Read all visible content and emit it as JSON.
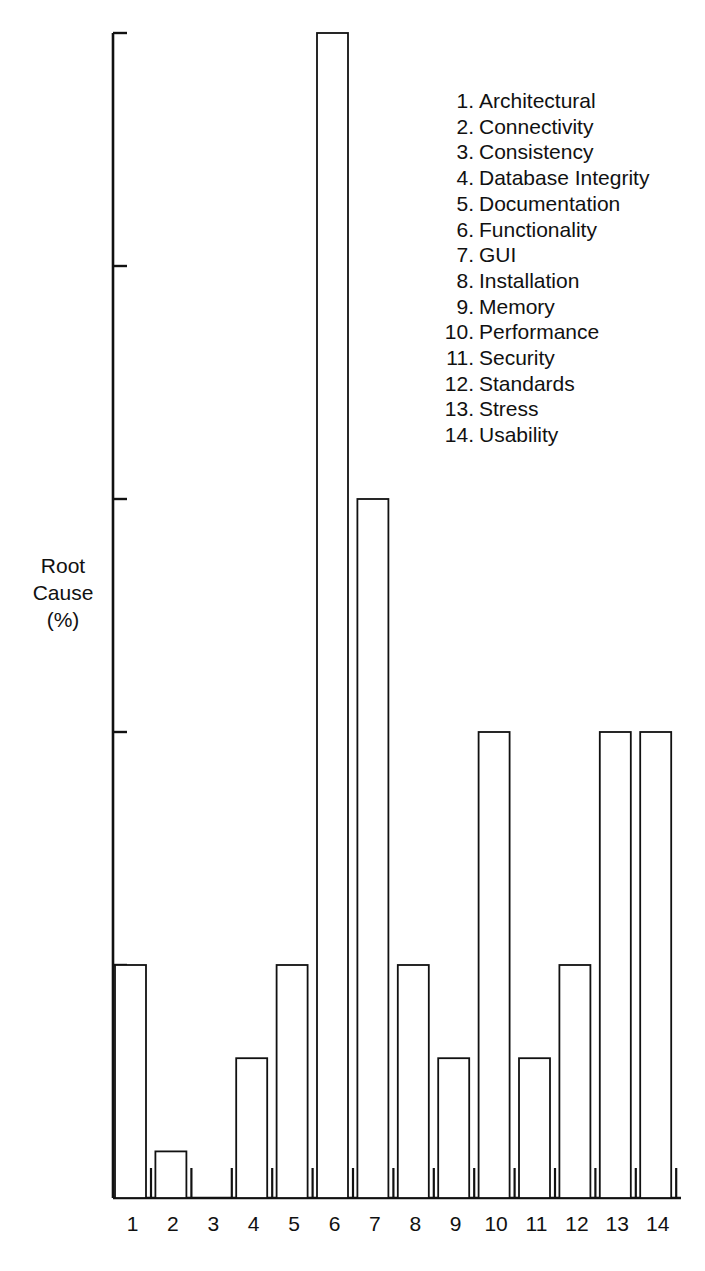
{
  "chart_data": {
    "type": "bar",
    "title": "",
    "xlabel": "",
    "ylabel": "Root Cause (%)",
    "ylabel_lines": [
      "Root",
      "Cause",
      "(%)"
    ],
    "y_tick_labels": "none (unlabeled ticks at equal intervals)",
    "ylim": [
      0,
      5
    ],
    "y_ticks": [
      0,
      1,
      2,
      3,
      4,
      5
    ],
    "grid": false,
    "legend_position": "upper right (inside plot)",
    "categories": [
      "1",
      "2",
      "3",
      "4",
      "5",
      "6",
      "7",
      "8",
      "9",
      "10",
      "11",
      "12",
      "13",
      "14"
    ],
    "category_names": [
      "Architectural",
      "Connectivity",
      "Consistency",
      "Database Integrity",
      "Documentation",
      "Functionality",
      "GUI",
      "Installation",
      "Memory",
      "Performance",
      "Security",
      "Standards",
      "Stress",
      "Usability"
    ],
    "values": [
      1,
      0.2,
      0,
      0.6,
      1,
      5,
      3,
      1,
      0.6,
      2,
      0.6,
      1,
      2,
      2
    ],
    "value_units": "tick intervals (y-axis unlabeled)"
  },
  "legend": {
    "items": [
      {
        "num": "1.",
        "label": "Architectural"
      },
      {
        "num": "2.",
        "label": "Connectivity"
      },
      {
        "num": "3.",
        "label": "Consistency"
      },
      {
        "num": "4.",
        "label": "Database Integrity"
      },
      {
        "num": "5.",
        "label": "Documentation"
      },
      {
        "num": "6.",
        "label": "Functionality"
      },
      {
        "num": "7.",
        "label": "GUI"
      },
      {
        "num": "8.",
        "label": "Installation"
      },
      {
        "num": "9.",
        "label": "Memory"
      },
      {
        "num": "10.",
        "label": "Performance"
      },
      {
        "num": "11.",
        "label": "Security"
      },
      {
        "num": "12.",
        "label": "Standards"
      },
      {
        "num": "13.",
        "label": "Stress"
      },
      {
        "num": "14.",
        "label": "Usability"
      }
    ]
  },
  "colors": {
    "line": "#111111",
    "bar_fill": "#ffffff",
    "background": "#ffffff"
  }
}
